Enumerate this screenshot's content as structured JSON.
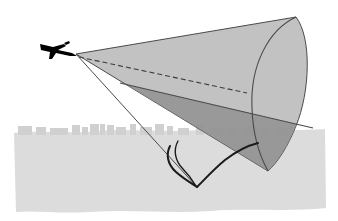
{
  "figure": {
    "type": "diagram",
    "width": 338,
    "height": 221,
    "background_color": "#ffffff"
  },
  "colors": {
    "background": "#ffffff",
    "ground_plane": "#dcdcdc",
    "skyline": "#d0d0d0",
    "mach_cone_fill": "#b4b4b4",
    "mach_cone_overlap_fill": "#8f8f8f",
    "cone_outline": "#4a4a4a",
    "ground_line": "#4a4a4a",
    "axis_dashed_line": "#3c3c3c",
    "aircraft_silhouette": "#000000",
    "boom_curve": "#1a1a1a"
  },
  "elements": {
    "aircraft": {
      "name": "supersonic aircraft silhouette",
      "position": {
        "x": 55,
        "y": 48
      },
      "heading": "left",
      "fill": "#000000"
    },
    "cone_apex": {
      "name": "Mach cone apex at aircraft nose",
      "x": 76,
      "y": 54
    },
    "mach_cone": {
      "name": "Mach shock cone",
      "fill": "#b4b4b4",
      "stroke": "#4a4a4a",
      "stroke_width": 1,
      "base_ellipse": {
        "center_x": 243,
        "center_y": 92,
        "rx": 58,
        "ry": 78,
        "rotation_deg": -16
      }
    },
    "cone_axis": {
      "name": "cone centerline / flight path axis",
      "style": "dashed",
      "dash_pattern": "5 3",
      "from": {
        "x": 78,
        "y": 57
      },
      "to": {
        "x": 243,
        "y": 92
      }
    },
    "ground_line": {
      "name": "ground plane trace line",
      "style": "solid",
      "from": {
        "x": 120,
        "y": 83
      },
      "to": {
        "x": 313,
        "y": 128
      }
    },
    "boom_carpet_curve": {
      "name": "hyperbolic sonic boom carpet on the ground",
      "stroke": "#1a1a1a",
      "stroke_width": 2,
      "vertex": {
        "x": 196,
        "y": 186
      }
    },
    "ground_plane": {
      "name": "ground / terrain band",
      "fill": "#dcdcdc",
      "top_y": 126,
      "bottom_y": 213
    },
    "skyline": {
      "name": "city skyline silhouette",
      "fill": "#d0d0d0",
      "baseline_y": 131,
      "buildings": [
        {
          "x": 18,
          "w": 14,
          "h": 5
        },
        {
          "x": 36,
          "w": 10,
          "h": 4
        },
        {
          "x": 50,
          "w": 18,
          "h": 3
        },
        {
          "x": 72,
          "w": 8,
          "h": 6
        },
        {
          "x": 82,
          "w": 6,
          "h": 4
        },
        {
          "x": 90,
          "w": 9,
          "h": 8
        },
        {
          "x": 100,
          "w": 5,
          "h": 11
        },
        {
          "x": 107,
          "w": 7,
          "h": 6
        },
        {
          "x": 116,
          "w": 10,
          "h": 4
        },
        {
          "x": 130,
          "w": 6,
          "h": 7
        },
        {
          "x": 140,
          "w": 12,
          "h": 4
        },
        {
          "x": 155,
          "w": 9,
          "h": 9
        },
        {
          "x": 167,
          "w": 6,
          "h": 5
        },
        {
          "x": 178,
          "w": 11,
          "h": 3
        },
        {
          "x": 196,
          "w": 8,
          "h": 6
        },
        {
          "x": 210,
          "w": 14,
          "h": 4
        },
        {
          "x": 228,
          "w": 9,
          "h": 3
        },
        {
          "x": 245,
          "w": 12,
          "h": 5
        },
        {
          "x": 262,
          "w": 8,
          "h": 3
        },
        {
          "x": 278,
          "w": 15,
          "h": 4
        }
      ],
      "antennas": [
        {
          "x": 102,
          "h": 9
        },
        {
          "x": 104,
          "h": 6
        },
        {
          "x": 157,
          "h": 11
        },
        {
          "x": 159,
          "h": 7
        }
      ]
    }
  }
}
